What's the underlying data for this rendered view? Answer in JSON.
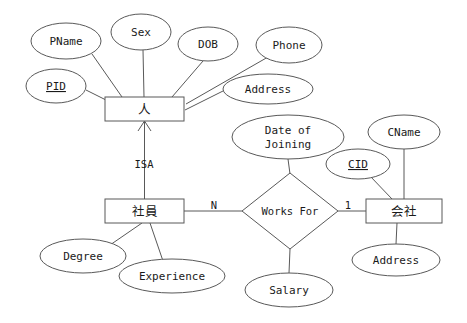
{
  "diagram": {
    "entities": [
      {
        "id": "person",
        "label": "人",
        "cx": 144.5,
        "cy": 109,
        "w": 79,
        "h": 24
      },
      {
        "id": "employee",
        "label": "社員",
        "cx": 144.5,
        "cy": 211,
        "w": 79,
        "h": 24
      },
      {
        "id": "company",
        "label": "会社",
        "cx": 404,
        "cy": 211,
        "w": 76,
        "h": 24
      }
    ],
    "relationships": [
      {
        "id": "works-for",
        "label": "Works For",
        "cx": 290,
        "cy": 211,
        "rx": 48,
        "ry": 38
      }
    ],
    "attributes": [
      {
        "id": "pname",
        "label": "PName",
        "cx": 66,
        "cy": 41,
        "rx": 35,
        "ry": 18,
        "key": false,
        "owner": "person"
      },
      {
        "id": "sex",
        "label": "Sex",
        "cx": 141,
        "cy": 32,
        "rx": 30,
        "ry": 18,
        "key": false,
        "owner": "person"
      },
      {
        "id": "dob",
        "label": "DOB",
        "cx": 208,
        "cy": 44,
        "rx": 30,
        "ry": 17,
        "key": false,
        "owner": "person"
      },
      {
        "id": "phone",
        "label": "Phone",
        "cx": 289,
        "cy": 45,
        "rx": 33,
        "ry": 18,
        "key": false,
        "owner": "person"
      },
      {
        "id": "pid",
        "label": "PID",
        "cx": 56,
        "cy": 86,
        "rx": 30,
        "ry": 17,
        "key": true,
        "owner": "person"
      },
      {
        "id": "address-person",
        "label": "Address",
        "cx": 268,
        "cy": 89,
        "rx": 45,
        "ry": 15,
        "key": false,
        "owner": "person"
      },
      {
        "id": "degree",
        "label": "Degree",
        "cx": 83,
        "cy": 256,
        "rx": 43,
        "ry": 17,
        "key": false,
        "owner": "employee"
      },
      {
        "id": "experience",
        "label": "Experience",
        "cx": 172,
        "cy": 276,
        "rx": 53,
        "ry": 17,
        "key": false,
        "owner": "employee"
      },
      {
        "id": "date-of-joining",
        "label": "Date of\nJoining",
        "cx": 288,
        "cy": 137,
        "rx": 56,
        "ry": 22,
        "key": false,
        "owner": "works-for"
      },
      {
        "id": "salary",
        "label": "Salary",
        "cx": 289,
        "cy": 290,
        "rx": 44,
        "ry": 17,
        "key": false,
        "owner": "works-for"
      },
      {
        "id": "cname",
        "label": "CName",
        "cx": 404,
        "cy": 132,
        "rx": 36,
        "ry": 17,
        "key": false,
        "owner": "company"
      },
      {
        "id": "cid",
        "label": "CID",
        "cx": 358,
        "cy": 164,
        "rx": 32,
        "ry": 15,
        "key": true,
        "owner": "company"
      },
      {
        "id": "address-company",
        "label": "Address",
        "cx": 396,
        "cy": 260,
        "rx": 44,
        "ry": 16,
        "key": false,
        "owner": "company"
      }
    ],
    "cardinalities": [
      {
        "id": "card-n",
        "label": "N",
        "x": 214,
        "y": 206
      },
      {
        "id": "card-1",
        "label": "1",
        "x": 348,
        "y": 206
      }
    ],
    "isa": {
      "id": "isa",
      "label": "ISA",
      "x": 144,
      "y": 165
    },
    "colors": {
      "stroke": "#595959",
      "text": "#1a1a1a",
      "background": "#ffffff"
    }
  }
}
